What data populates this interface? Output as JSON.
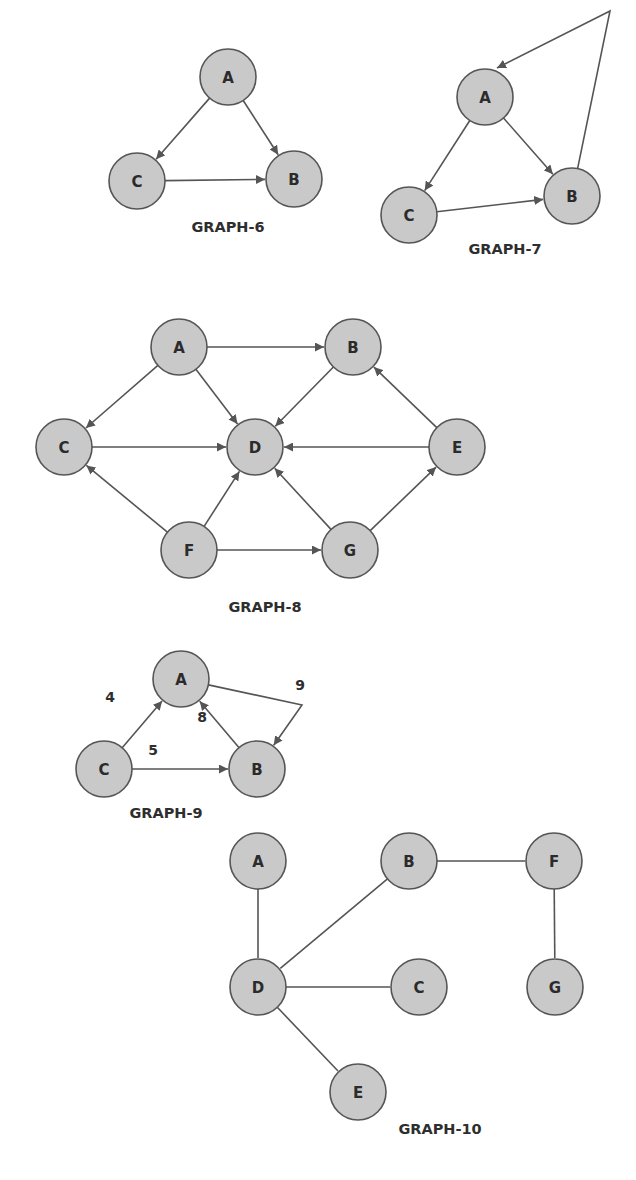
{
  "colors": {
    "node_fill": "#c9c9c9",
    "node_stroke": "#555555",
    "edge": "#555555",
    "text": "#2b2b2b",
    "background": "#ffffff"
  },
  "node_radius": 28,
  "graphs": [
    {
      "id": "graph6",
      "caption": "GRAPH-6",
      "caption_pos": [
        228,
        232
      ],
      "directed": true,
      "nodes": [
        {
          "id": "A",
          "label": "A",
          "x": 228,
          "y": 77
        },
        {
          "id": "C",
          "label": "C",
          "x": 137,
          "y": 181
        },
        {
          "id": "B",
          "label": "B",
          "x": 294,
          "y": 179
        }
      ],
      "edges": [
        {
          "from": "A",
          "to": "C"
        },
        {
          "from": "A",
          "to": "B"
        },
        {
          "from": "C",
          "to": "B"
        }
      ]
    },
    {
      "id": "graph7",
      "caption": "GRAPH-7",
      "caption_pos": [
        505,
        254
      ],
      "directed": true,
      "nodes": [
        {
          "id": "A",
          "label": "A",
          "x": 485,
          "y": 97
        },
        {
          "id": "C",
          "label": "C",
          "x": 409,
          "y": 215
        },
        {
          "id": "B",
          "label": "B",
          "x": 572,
          "y": 196
        }
      ],
      "edges": [
        {
          "from": "A",
          "to": "C"
        },
        {
          "from": "A",
          "to": "B"
        },
        {
          "from": "C",
          "to": "B"
        },
        {
          "from": "B",
          "to": "A",
          "via": [
            [
              610,
              11
            ]
          ],
          "end_point": [
            497,
            68
          ]
        }
      ]
    },
    {
      "id": "graph8",
      "caption": "GRAPH-8",
      "caption_pos": [
        265,
        612
      ],
      "directed": true,
      "nodes": [
        {
          "id": "A",
          "label": "A",
          "x": 179,
          "y": 347
        },
        {
          "id": "B",
          "label": "B",
          "x": 353,
          "y": 347
        },
        {
          "id": "C",
          "label": "C",
          "x": 64,
          "y": 447
        },
        {
          "id": "D",
          "label": "D",
          "x": 255,
          "y": 447
        },
        {
          "id": "E",
          "label": "E",
          "x": 457,
          "y": 447
        },
        {
          "id": "F",
          "label": "F",
          "x": 189,
          "y": 550
        },
        {
          "id": "G",
          "label": "G",
          "x": 350,
          "y": 550
        }
      ],
      "edges": [
        {
          "from": "A",
          "to": "B"
        },
        {
          "from": "A",
          "to": "C"
        },
        {
          "from": "A",
          "to": "D"
        },
        {
          "from": "B",
          "to": "D"
        },
        {
          "from": "C",
          "to": "D"
        },
        {
          "from": "E",
          "to": "D"
        },
        {
          "from": "E",
          "to": "B"
        },
        {
          "from": "F",
          "to": "C"
        },
        {
          "from": "F",
          "to": "D"
        },
        {
          "from": "F",
          "to": "G"
        },
        {
          "from": "G",
          "to": "D"
        },
        {
          "from": "G",
          "to": "E"
        }
      ]
    },
    {
      "id": "graph9",
      "caption": "GRAPH-9",
      "caption_pos": [
        166,
        818
      ],
      "directed": true,
      "weighted": true,
      "nodes": [
        {
          "id": "A",
          "label": "A",
          "x": 181,
          "y": 679
        },
        {
          "id": "B",
          "label": "B",
          "x": 257,
          "y": 769
        },
        {
          "id": "C",
          "label": "C",
          "x": 104,
          "y": 769
        }
      ],
      "edges": [
        {
          "from": "C",
          "to": "A",
          "weight": "4",
          "label_pos": [
            110,
            702
          ]
        },
        {
          "from": "C",
          "to": "B",
          "weight": "5",
          "label_pos": [
            153,
            755
          ]
        },
        {
          "from": "B",
          "to": "A",
          "weight": "8",
          "label_pos": [
            202,
            722
          ]
        },
        {
          "from": "A",
          "to": "B",
          "weight": "9",
          "via": [
            [
              302,
              705
            ]
          ],
          "label_pos": [
            300,
            690
          ]
        }
      ]
    },
    {
      "id": "graph10",
      "caption": "GRAPH-10",
      "caption_pos": [
        440,
        1134
      ],
      "directed": false,
      "nodes": [
        {
          "id": "A",
          "label": "A",
          "x": 258,
          "y": 861
        },
        {
          "id": "B",
          "label": "B",
          "x": 409,
          "y": 861
        },
        {
          "id": "F",
          "label": "F",
          "x": 554,
          "y": 861
        },
        {
          "id": "D",
          "label": "D",
          "x": 258,
          "y": 987
        },
        {
          "id": "C",
          "label": "C",
          "x": 419,
          "y": 987
        },
        {
          "id": "G",
          "label": "G",
          "x": 555,
          "y": 987
        },
        {
          "id": "E",
          "label": "E",
          "x": 358,
          "y": 1092
        }
      ],
      "edges": [
        {
          "from": "A",
          "to": "D"
        },
        {
          "from": "B",
          "to": "D"
        },
        {
          "from": "B",
          "to": "F"
        },
        {
          "from": "D",
          "to": "C"
        },
        {
          "from": "D",
          "to": "E"
        },
        {
          "from": "F",
          "to": "G"
        }
      ]
    }
  ]
}
